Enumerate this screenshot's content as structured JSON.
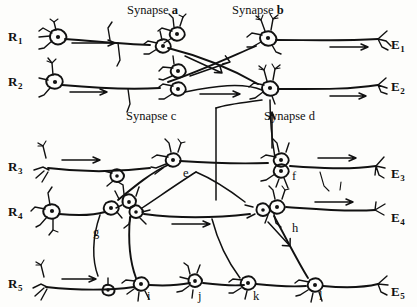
{
  "figure": {
    "ink_color": "#111111",
    "background_color": "#fdfdfb"
  },
  "receptors": [
    {
      "id": "R1",
      "letter": "R",
      "index": "1",
      "x": 8,
      "y": 30
    },
    {
      "id": "R2",
      "letter": "R",
      "index": "2",
      "x": 8,
      "y": 75
    },
    {
      "id": "R3",
      "letter": "R",
      "index": "3",
      "x": 8,
      "y": 160
    },
    {
      "id": "R4",
      "letter": "R",
      "index": "4",
      "x": 8,
      "y": 205
    },
    {
      "id": "R5",
      "letter": "R",
      "index": "5",
      "x": 8,
      "y": 277
    }
  ],
  "effectors": [
    {
      "id": "E1",
      "letter": "E",
      "index": "1",
      "x": 391,
      "y": 38
    },
    {
      "id": "E2",
      "letter": "E",
      "index": "2",
      "x": 391,
      "y": 80
    },
    {
      "id": "E3",
      "letter": "E",
      "index": "3",
      "x": 391,
      "y": 167
    },
    {
      "id": "E4",
      "letter": "E",
      "index": "4",
      "x": 391,
      "y": 211
    },
    {
      "id": "E5",
      "letter": "E",
      "index": "5",
      "x": 391,
      "y": 285
    }
  ],
  "synapse_labels": [
    {
      "id": "synapse-a",
      "prefix": "Synapse ",
      "letter": "a",
      "x": 127,
      "y": 4
    },
    {
      "id": "synapse-b",
      "prefix": "Synapse ",
      "letter": "b",
      "x": 232,
      "y": 4
    },
    {
      "id": "synapse-c",
      "prefix": "Synapse ",
      "letter": "c",
      "x": 126,
      "y": 110
    },
    {
      "id": "synapse-d",
      "prefix": "Synapse ",
      "letter": "d",
      "x": 264,
      "y": 110
    }
  ],
  "point_labels": [
    {
      "id": "label-e",
      "text": "e",
      "x": 183,
      "y": 167
    },
    {
      "id": "label-f",
      "text": "f",
      "x": 292,
      "y": 170
    },
    {
      "id": "label-g",
      "text": "g",
      "x": 93,
      "y": 226
    },
    {
      "id": "label-h",
      "text": "h",
      "x": 292,
      "y": 222
    },
    {
      "id": "label-i",
      "text": "i",
      "x": 147,
      "y": 290
    },
    {
      "id": "label-j",
      "text": "j",
      "x": 198,
      "y": 290
    },
    {
      "id": "label-k",
      "text": "k",
      "x": 253,
      "y": 290
    },
    {
      "id": "label-l",
      "text": "l",
      "x": 319,
      "y": 290
    }
  ],
  "diagram_elements": {
    "rows": [
      {
        "id": "row-R1",
        "axon_y": 42,
        "soma_x": 58,
        "soma_y": 37
      },
      {
        "id": "row-R2",
        "axon_y": 88,
        "soma_x": 55,
        "soma_y": 82
      },
      {
        "id": "row-R3",
        "axon_y": 170,
        "soma_x": 48,
        "soma_y": 166
      },
      {
        "id": "row-R4",
        "axon_y": 215,
        "soma_x": 52,
        "soma_y": 211
      },
      {
        "id": "row-R5",
        "axon_y": 287,
        "soma_x": 46,
        "soma_y": 285
      }
    ],
    "synapse_nodes": [
      {
        "id": "node-a",
        "x": 163,
        "y": 46
      },
      {
        "id": "node-b",
        "x": 268,
        "y": 38
      },
      {
        "id": "node-c",
        "x": 178,
        "y": 79
      },
      {
        "id": "node-d",
        "x": 270,
        "y": 88
      },
      {
        "id": "node-e",
        "x": 173,
        "y": 160
      },
      {
        "id": "node-f",
        "x": 281,
        "y": 166
      },
      {
        "id": "node-g",
        "x": 113,
        "y": 208
      },
      {
        "id": "node-h",
        "x": 282,
        "y": 208
      },
      {
        "id": "node-i",
        "x": 141,
        "y": 284
      },
      {
        "id": "node-j",
        "x": 195,
        "y": 281
      },
      {
        "id": "node-k",
        "x": 248,
        "y": 283
      },
      {
        "id": "node-l",
        "x": 315,
        "y": 285
      }
    ]
  }
}
